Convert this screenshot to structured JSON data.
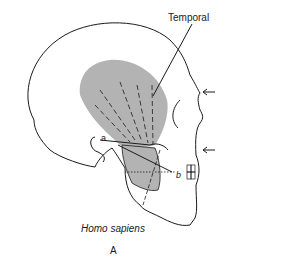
{
  "figure": {
    "muscle_label": "Temporal",
    "species_caption": "Homo sapiens",
    "panel_label": "A",
    "point_labels": {
      "a": "a",
      "b": "b"
    },
    "arrows": [
      {
        "direction": "left",
        "position": "brow"
      },
      {
        "direction": "left",
        "position": "nose-base"
      }
    ],
    "colors": {
      "muscle_fill": "#b3b3b3",
      "outline": "#1a1a1a",
      "background": "#ffffff"
    }
  }
}
